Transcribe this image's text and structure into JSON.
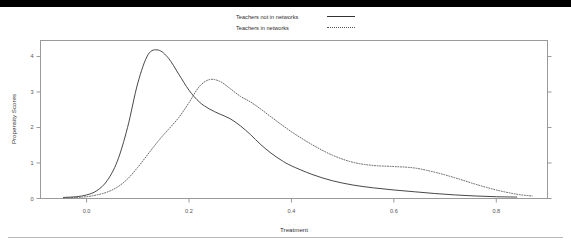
{
  "figure": {
    "background_color": "#ffffff",
    "top_band_color": "#000000",
    "frame_color": "#9a9a9a",
    "rule_color": "#b8b8b8"
  },
  "legend": {
    "position": "top-center",
    "entries": [
      {
        "label": "Teachers not in networks",
        "style": "solid",
        "color": "#333333"
      },
      {
        "label": "Teachers in networks",
        "style": "dotted",
        "color": "#555555"
      }
    ]
  },
  "chart_data": {
    "type": "line",
    "title": "",
    "subtitle": "",
    "xlabel": "Treatment",
    "ylabel": "Propensity Scores",
    "xlim": [
      -0.09,
      0.9
    ],
    "ylim": [
      0,
      4.45
    ],
    "xticks": [
      0.0,
      0.2,
      0.4,
      0.6,
      0.8
    ],
    "xticklabels": [
      "0.0",
      "0.2",
      "0.4",
      "0.6",
      "0.8"
    ],
    "yticks": [
      0,
      1,
      2,
      3,
      4
    ],
    "yticklabels": [
      "0",
      "1",
      "2",
      "3",
      "4"
    ],
    "grid": false,
    "legend_position": "top-center",
    "series": [
      {
        "name": "Teachers not in networks",
        "style": "solid",
        "color": "#333333",
        "x": [
          -0.045,
          -0.02,
          0.0,
          0.02,
          0.04,
          0.06,
          0.08,
          0.1,
          0.12,
          0.14,
          0.16,
          0.18,
          0.2,
          0.22,
          0.24,
          0.26,
          0.28,
          0.3,
          0.32,
          0.34,
          0.36,
          0.38,
          0.4,
          0.44,
          0.48,
          0.52,
          0.56,
          0.6,
          0.64,
          0.68,
          0.72,
          0.76,
          0.8,
          0.84
        ],
        "y": [
          0.03,
          0.05,
          0.1,
          0.22,
          0.5,
          1.05,
          2.0,
          3.25,
          4.05,
          4.18,
          3.95,
          3.5,
          3.05,
          2.72,
          2.52,
          2.38,
          2.25,
          2.05,
          1.8,
          1.52,
          1.28,
          1.08,
          0.92,
          0.68,
          0.5,
          0.38,
          0.3,
          0.24,
          0.19,
          0.14,
          0.1,
          0.07,
          0.05,
          0.04
        ]
      },
      {
        "name": "Teachers in networks",
        "style": "dotted",
        "color": "#555555",
        "x": [
          -0.045,
          -0.02,
          0.0,
          0.02,
          0.04,
          0.06,
          0.08,
          0.1,
          0.12,
          0.14,
          0.16,
          0.18,
          0.2,
          0.22,
          0.24,
          0.26,
          0.28,
          0.3,
          0.32,
          0.34,
          0.36,
          0.4,
          0.44,
          0.48,
          0.52,
          0.56,
          0.6,
          0.64,
          0.68,
          0.72,
          0.76,
          0.8,
          0.84,
          0.87
        ],
        "y": [
          0.02,
          0.03,
          0.05,
          0.1,
          0.18,
          0.32,
          0.55,
          0.88,
          1.25,
          1.62,
          1.95,
          2.28,
          2.7,
          3.15,
          3.35,
          3.3,
          3.1,
          2.88,
          2.72,
          2.52,
          2.3,
          1.88,
          1.52,
          1.22,
          1.02,
          0.93,
          0.9,
          0.86,
          0.74,
          0.58,
          0.4,
          0.24,
          0.12,
          0.07
        ]
      }
    ]
  }
}
